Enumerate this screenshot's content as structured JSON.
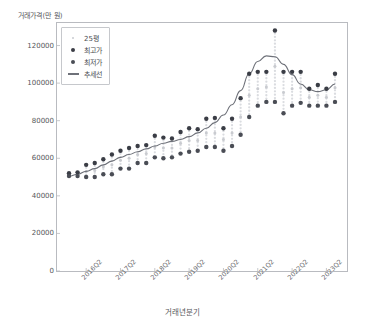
{
  "chart_data": {
    "type": "scatter",
    "title": "",
    "ylabel": "거래가격(만 원)",
    "xlabel": "거래년분기",
    "ylim": [
      0,
      132000
    ],
    "yticks": [
      0,
      20000,
      40000,
      60000,
      80000,
      100000,
      120000
    ],
    "ytick_labels": [
      "0",
      "20000",
      "40000",
      "60000",
      "80000",
      "100000",
      "120000"
    ],
    "grid": false,
    "legend_position": "upper-left",
    "legend": [
      {
        "label": "25평",
        "marker": "small-dot",
        "color": "#c9cbd0"
      },
      {
        "label": "최고가",
        "marker": "dot",
        "color": "#3a3d45"
      },
      {
        "label": "최저가",
        "marker": "dot",
        "color": "#4a4d55"
      },
      {
        "label": "추세선",
        "marker": "line",
        "color": "#6e7179"
      }
    ],
    "xtick_labels": [
      "2016Q2",
      "2017Q2",
      "2018Q2",
      "2019Q2",
      "2020Q2",
      "2021Q2",
      "2022Q2",
      "2023Q2"
    ],
    "xtick_indices": [
      2,
      6,
      10,
      14,
      18,
      22,
      26,
      30
    ],
    "x_index_range": [
      0,
      31
    ],
    "categories": [
      "2016Q1",
      "2016Q2",
      "2016Q3",
      "2016Q4",
      "2017Q1",
      "2017Q2",
      "2017Q3",
      "2017Q4",
      "2018Q1",
      "2018Q2",
      "2018Q3",
      "2018Q4",
      "2019Q1",
      "2019Q2",
      "2019Q3",
      "2019Q4",
      "2020Q1",
      "2020Q2",
      "2020Q3",
      "2020Q4",
      "2021Q1",
      "2021Q2",
      "2021Q3",
      "2021Q4",
      "2022Q1",
      "2022Q2",
      "2022Q3",
      "2022Q4",
      "2023Q1",
      "2023Q2",
      "2023Q3",
      "2023Q4"
    ],
    "series": [
      {
        "name": "최고가",
        "marker": "dot",
        "color": "#3a3d45",
        "values": [
          52000,
          52500,
          56500,
          57500,
          59500,
          62000,
          64000,
          65500,
          66500,
          67000,
          72000,
          71000,
          70500,
          74000,
          76000,
          75500,
          81000,
          81500,
          76000,
          81000,
          92000,
          105000,
          106000,
          106000,
          128000,
          106000,
          106000,
          106000,
          97000,
          99000,
          97000,
          105000
        ]
      },
      {
        "name": "최저가",
        "marker": "dot",
        "color": "#4a4d55",
        "values": [
          50500,
          50500,
          50000,
          50000,
          51500,
          51500,
          54500,
          54500,
          57500,
          57500,
          60500,
          60000,
          60500,
          62500,
          63500,
          64000,
          66000,
          66000,
          64000,
          66500,
          72500,
          82000,
          88000,
          90000,
          90000,
          84000,
          88000,
          89500,
          88000,
          88000,
          88000,
          90000
        ]
      },
      {
        "name": "25평",
        "marker": "small-dot",
        "color": "#c9cbd0",
        "values": [
          51200,
          51500,
          53000,
          53500,
          55500,
          56500,
          59000,
          60000,
          62000,
          62500,
          66000,
          65500,
          65500,
          68000,
          69500,
          69500,
          73500,
          73500,
          70000,
          73500,
          82000,
          93500,
          97000,
          98000,
          109000,
          95000,
          97000,
          97500,
          92500,
          93500,
          92500,
          97500
        ]
      }
    ],
    "trend_line": {
      "name": "추세선",
      "color": "#6e7179",
      "values": [
        50500,
        51500,
        53000,
        54500,
        56500,
        58500,
        60500,
        62000,
        63500,
        65000,
        66500,
        68000,
        69000,
        70000,
        71500,
        73500,
        76000,
        79000,
        83000,
        88500,
        96000,
        105000,
        111500,
        114500,
        114000,
        110000,
        104500,
        99500,
        96500,
        95500,
        96500,
        99500
      ]
    }
  }
}
